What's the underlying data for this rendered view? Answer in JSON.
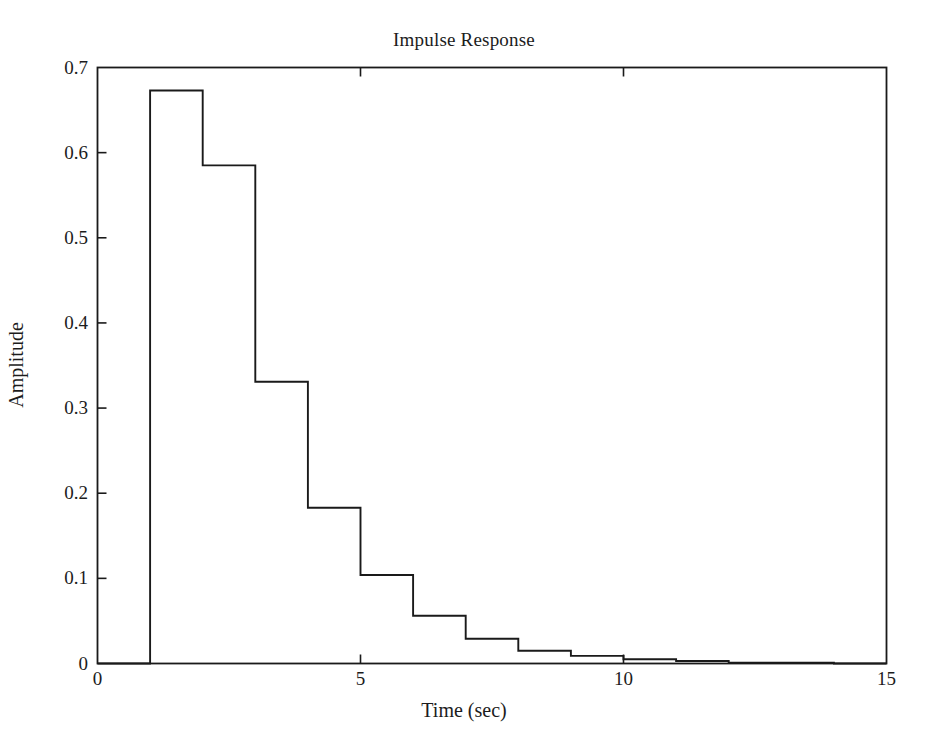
{
  "chart_data": {
    "type": "line",
    "title": "Impulse Response",
    "xlabel": "Time (sec)",
    "ylabel": "Amplitude",
    "xlim": [
      0,
      15
    ],
    "ylim": [
      0,
      0.7
    ],
    "grid": false,
    "legend": null,
    "drawstyle": "steps-post",
    "line_color": "#1a1a1a",
    "line_width": 1.8,
    "xticks": [
      0,
      5,
      10,
      15
    ],
    "xtick_labels": [
      "0",
      "5",
      "10",
      "15"
    ],
    "yticks": [
      0,
      0.1,
      0.2,
      0.3,
      0.4,
      0.5,
      0.6,
      0.7
    ],
    "ytick_labels": [
      "0",
      "0.1",
      "0.2",
      "0.3",
      "0.4",
      "0.5",
      "0.6",
      "0.7"
    ],
    "x": [
      0,
      1,
      2,
      3,
      4,
      5,
      6,
      7,
      8,
      9,
      10,
      11,
      12,
      13,
      14,
      15
    ],
    "values": [
      0,
      0.673,
      0.585,
      0.331,
      0.183,
      0.104,
      0.056,
      0.029,
      0.015,
      0.009,
      0.005,
      0.003,
      0.001,
      0.001,
      0,
      0
    ],
    "series": [
      {
        "name": "impulse response",
        "values": [
          0,
          0.673,
          0.585,
          0.331,
          0.183,
          0.104,
          0.056,
          0.029,
          0.015,
          0.009,
          0.005,
          0.003,
          0.001,
          0.001,
          0,
          0
        ]
      }
    ]
  },
  "figure": {
    "background": "#ffffff",
    "axes_color": "#1a1a1a"
  }
}
